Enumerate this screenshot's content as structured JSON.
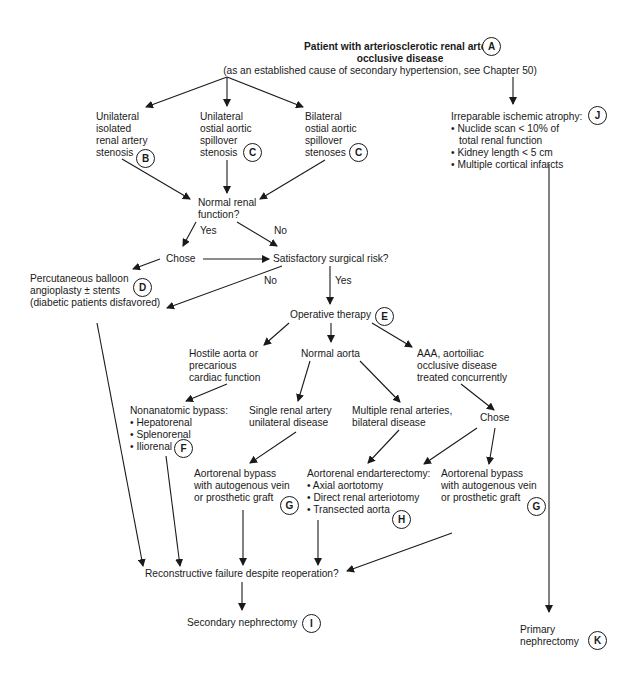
{
  "diagram": {
    "type": "flowchart",
    "nodes": {
      "A": {
        "lines": [
          "Patient with arteriosclerotic renal artery",
          "occlusive disease",
          "(as an established cause of secondary hypertension, see Chapter 50)"
        ],
        "badge": "A"
      },
      "B": {
        "lines": [
          "Unilateral",
          "isolated",
          "renal artery",
          "stenosis"
        ],
        "badge": "B"
      },
      "C1": {
        "lines": [
          "Unilateral",
          "ostial aortic",
          "spillover",
          "stenosis"
        ],
        "badge": "C"
      },
      "C2": {
        "lines": [
          "Bilateral",
          "ostial aortic",
          "spillover",
          "stenoses"
        ],
        "badge": "C"
      },
      "J": {
        "title": "Irreparable ischemic atrophy:",
        "bullets": [
          "• Nuclide scan < 10% of",
          "  total renal function",
          "• Kidney length < 5 cm",
          "• Multiple cortical infarcts"
        ],
        "badge": "J"
      },
      "normal_renal": {
        "lines": [
          "Normal renal",
          "function?"
        ]
      },
      "chose1": {
        "lines": [
          "Chose"
        ]
      },
      "surgical_risk": {
        "lines": [
          "Satisfactory surgical risk?"
        ]
      },
      "D": {
        "lines": [
          "Percutaneous balloon",
          "angioplasty ± stents",
          "(diabetic patients disfavored)"
        ],
        "badge": "D"
      },
      "E": {
        "lines": [
          "Operative therapy"
        ],
        "badge": "E"
      },
      "hostile": {
        "lines": [
          "Hostile aorta or",
          "precarious",
          "cardiac function"
        ]
      },
      "normal_aorta": {
        "lines": [
          "Normal aorta"
        ]
      },
      "aaa": {
        "lines": [
          "AAA, aortoiliac",
          "occlusive disease",
          "treated concurrently"
        ]
      },
      "F": {
        "title": "Nonanatomic bypass:",
        "bullets": [
          "• Hepatorenal",
          "• Splenorenal",
          "• Iliorenal"
        ],
        "badge": "F"
      },
      "single": {
        "lines": [
          "Single renal artery",
          "unilateral disease"
        ]
      },
      "multiple": {
        "lines": [
          "Multiple renal arteries,",
          "bilateral disease"
        ]
      },
      "chose2": {
        "lines": [
          "Chose"
        ]
      },
      "G1": {
        "lines": [
          "Aortorenal bypass",
          "with autogenous vein",
          "or prosthetic graft"
        ],
        "badge": "G"
      },
      "H": {
        "title": "Aortorenal endarterectomy:",
        "bullets": [
          "• Axial aortotomy",
          "• Direct renal arteriotomy",
          "• Transected aorta"
        ],
        "badge": "H"
      },
      "G2": {
        "lines": [
          "Aortorenal bypass",
          "with autogenous vein",
          "or prosthetic graft"
        ],
        "badge": "G"
      },
      "reconstructive": {
        "lines": [
          "Reconstructive failure despite reoperation?"
        ]
      },
      "I": {
        "lines": [
          "Secondary nephrectomy"
        ],
        "badge": "I"
      },
      "K": {
        "lines": [
          "Primary",
          "nephrectomy"
        ],
        "badge": "K"
      }
    },
    "edge_labels": {
      "yes1": "Yes",
      "no1": "No",
      "no2": "No",
      "yes2": "Yes"
    },
    "edges": [
      [
        "A",
        "B"
      ],
      [
        "A",
        "C1"
      ],
      [
        "A",
        "C2"
      ],
      [
        "A",
        "J"
      ],
      [
        "B",
        "normal_renal"
      ],
      [
        "C1",
        "normal_renal"
      ],
      [
        "C2",
        "normal_renal"
      ],
      [
        "normal_renal",
        "chose1",
        "Yes"
      ],
      [
        "normal_renal",
        "surgical_risk",
        "No"
      ],
      [
        "chose1",
        "D"
      ],
      [
        "chose1",
        "surgical_risk"
      ],
      [
        "surgical_risk",
        "D",
        "No"
      ],
      [
        "surgical_risk",
        "E",
        "Yes"
      ],
      [
        "E",
        "hostile"
      ],
      [
        "E",
        "normal_aorta"
      ],
      [
        "E",
        "aaa"
      ],
      [
        "hostile",
        "F"
      ],
      [
        "normal_aorta",
        "single"
      ],
      [
        "normal_aorta",
        "multiple"
      ],
      [
        "aaa",
        "chose2"
      ],
      [
        "single",
        "G1"
      ],
      [
        "multiple",
        "H"
      ],
      [
        "chose2",
        "H"
      ],
      [
        "chose2",
        "G2"
      ],
      [
        "D",
        "reconstructive"
      ],
      [
        "F",
        "reconstructive"
      ],
      [
        "G1",
        "reconstructive"
      ],
      [
        "H",
        "reconstructive"
      ],
      [
        "G2",
        "reconstructive"
      ],
      [
        "reconstructive",
        "I"
      ],
      [
        "J",
        "K"
      ]
    ]
  }
}
